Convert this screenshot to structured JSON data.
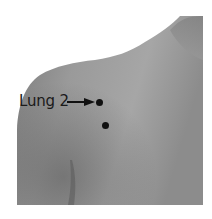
{
  "figure": {
    "points": [
      {
        "label": "Lung 2",
        "x": 99,
        "y": 103
      },
      {
        "label": "",
        "x": 105,
        "y": 126
      }
    ],
    "label_text": "Lung 2",
    "colors": {
      "background": "#ffffff",
      "skin_light": "#a8a8a8",
      "skin_dark": "#6e6e6e",
      "marker": "#111111"
    }
  }
}
